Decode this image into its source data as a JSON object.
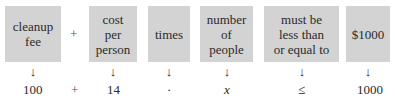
{
  "boxes": [
    {
      "label": "cleanup\nfee"
    },
    {
      "label": "cost\nper\nperson"
    },
    {
      "label": "times"
    },
    {
      "label": "number\nof\npeople"
    },
    {
      "label": "must be\nless than\nor equal to"
    },
    {
      "label": "$1000"
    }
  ],
  "top_operators": [
    "+"
  ],
  "arrow_glyph": "↓",
  "bottom_values": [
    "100",
    "+",
    "14",
    "·",
    "x",
    "≤",
    "1000"
  ],
  "colors": {
    "box_fill": "#d3d3d3",
    "text": "#2a2a2a"
  }
}
